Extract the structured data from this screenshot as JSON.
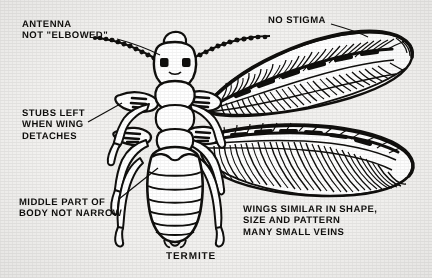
{
  "figure": {
    "type": "line-illustration",
    "subject": "termite",
    "caption": "TERMITE",
    "background_color": "#f2f1ef",
    "ink_color": "#100f0d",
    "labels": [
      {
        "id": "antenna",
        "text": "ANTENNA\nNOT \"ELBOWED\"",
        "lines": [
          "ANTENNA",
          "NOT \"ELBOWED\""
        ],
        "position": "top-left",
        "leader_to": "right antenna base"
      },
      {
        "id": "stubs",
        "text": "STUBS LEFT\nWHEN WING\nDETACHES",
        "lines": [
          "STUBS LEFT",
          "WHEN WING",
          "DETACHES"
        ],
        "position": "middle-left",
        "leader_to": "left wing stub on thorax"
      },
      {
        "id": "middle",
        "text": "MIDDLE PART OF\nBODY NOT NARROW",
        "lines": [
          "MIDDLE PART OF",
          "BODY NOT NARROW"
        ],
        "position": "lower-left",
        "leader_to": "abdomen waist"
      },
      {
        "id": "stigma",
        "text": "NO STIGMA",
        "lines": [
          "NO STIGMA"
        ],
        "position": "top-right",
        "leader_to": "forewing leading edge"
      },
      {
        "id": "wings",
        "text": "WINGS SIMILAR IN SHAPE,\nSIZE AND PATTERN\nMANY SMALL VEINS",
        "lines": [
          "WINGS SIMILAR IN SHAPE,",
          "SIZE AND PATTERN",
          "MANY SMALL VEINS"
        ],
        "position": "bottom-right",
        "leader_to": null
      }
    ]
  }
}
